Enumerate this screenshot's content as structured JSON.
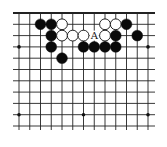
{
  "diagram": {
    "type": "go-board-fragment",
    "grid": {
      "cols": 13,
      "rows": 11,
      "x0": 19,
      "y0": 13,
      "dx": 10.75,
      "dy": 11.3,
      "line_color": "#222222",
      "top_edge_is_board_edge": true
    },
    "star_points": [
      {
        "col": 0,
        "row": 3
      },
      {
        "col": 12,
        "row": 3
      },
      {
        "col": 0,
        "row": 9
      },
      {
        "col": 6,
        "row": 9
      },
      {
        "col": 12,
        "row": 9
      }
    ],
    "stones": [
      {
        "color": "black",
        "col": 2,
        "row": 1
      },
      {
        "color": "black",
        "col": 3,
        "row": 1
      },
      {
        "color": "white",
        "col": 4,
        "row": 1
      },
      {
        "color": "white",
        "col": 8,
        "row": 1
      },
      {
        "color": "white",
        "col": 9,
        "row": 1
      },
      {
        "color": "black",
        "col": 10,
        "row": 1
      },
      {
        "color": "black",
        "col": 3,
        "row": 2
      },
      {
        "color": "white",
        "col": 4,
        "row": 2
      },
      {
        "color": "white",
        "col": 5,
        "row": 2
      },
      {
        "color": "white",
        "col": 6,
        "row": 2
      },
      {
        "color": "white",
        "col": 8,
        "row": 2
      },
      {
        "color": "black",
        "col": 9,
        "row": 2
      },
      {
        "color": "black",
        "col": 11,
        "row": 2
      },
      {
        "color": "black",
        "col": 3,
        "row": 3
      },
      {
        "color": "black",
        "col": 6,
        "row": 3
      },
      {
        "color": "black",
        "col": 7,
        "row": 3
      },
      {
        "color": "black",
        "col": 8,
        "row": 3
      },
      {
        "color": "black",
        "col": 9,
        "row": 3
      },
      {
        "color": "black",
        "col": 4,
        "row": 4
      }
    ],
    "labels": [
      {
        "text": "A",
        "col": 7,
        "row": 2
      }
    ]
  }
}
